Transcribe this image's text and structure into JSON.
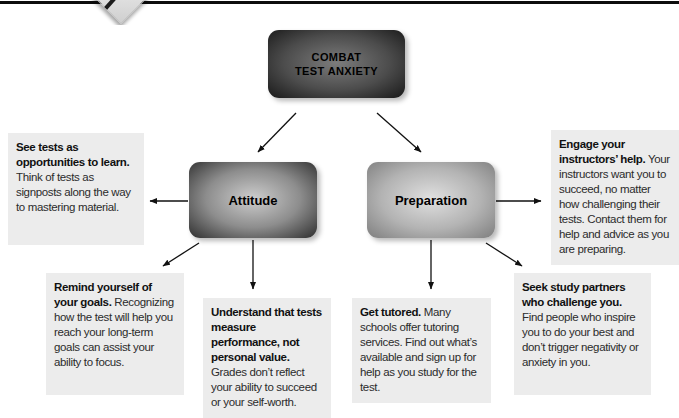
{
  "root_box": {
    "label": "COMBAT\nTEST ANXIETY"
  },
  "branch_boxes": [
    {
      "label": "Attitude"
    },
    {
      "label": "Preparation"
    }
  ],
  "notes": [
    {
      "bold": "See tests as opportunities to learn.",
      "text": "Think of tests as signposts along the way to mastering material."
    },
    {
      "bold": "Engage your instructors’ help.",
      "text": "Your instructors want you to succeed, no matter how challenging their tests. Contact them for help and advice as you are preparing."
    },
    {
      "bold": "Remind yourself of your goals.",
      "text": "Recognizing how the test will help you reach your long-term goals can assist your ability to focus."
    },
    {
      "bold": "Understand that tests measure performance, not personal value.",
      "text": "Grades don’t reflect your ability to succeed or your self-worth."
    },
    {
      "bold": "Get tutored.",
      "text": "Many schools offer tutoring services. Find out what’s available and sign up for help as you study for the test."
    },
    {
      "bold": "Seek study partners who challenge you.",
      "text": "Find people who inspire you to do your best and don’t trigger negativity or anxiety in you."
    }
  ],
  "decoration": {
    "marker_icon": "pencil-diamond"
  },
  "colors": {
    "note_bg": "#ececec",
    "root_center": "#7c7c7c",
    "root_edge": "#181818",
    "attitude_center": "#cdcdcd",
    "attitude_edge": "#2e2e2e",
    "preparation_center": "#e0e0e0",
    "preparation_edge": "#7e7e7e",
    "arrow": "#111111",
    "top_rule": "#0d0d0d"
  }
}
